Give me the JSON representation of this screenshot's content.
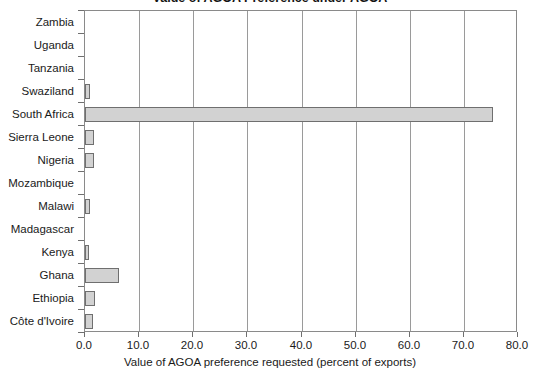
{
  "chart_data": {
    "type": "bar",
    "orientation": "horizontal",
    "title": "Value of AGOA Preference under AGOA",
    "xlabel": "Value of AGOA preference requested (percent of exports)",
    "ylabel": "",
    "xlim": [
      0.0,
      80.0
    ],
    "xticks": [
      "0.0",
      "10.0",
      "20.0",
      "30.0",
      "40.0",
      "50.0",
      "60.0",
      "70.0",
      "80.0"
    ],
    "xtick_values": [
      0,
      10,
      20,
      30,
      40,
      50,
      60,
      70,
      80
    ],
    "grid": "vertical",
    "legend": "none",
    "bar_color": "#d2d2d2",
    "bar_edge_color": "#6f6f6f",
    "categories": [
      "Zambia",
      "Uganda",
      "Tanzania",
      "Swaziland",
      "South Africa",
      "Sierra Leone",
      "Nigeria",
      "Mozambique",
      "Malawi",
      "Madagascar",
      "Kenya",
      "Ghana",
      "Ethiopia",
      "Côte d'Ivoire"
    ],
    "values": [
      0.0,
      0.0,
      0.0,
      1.0,
      75.4,
      1.7,
      1.7,
      0.0,
      0.9,
      0.0,
      0.8,
      6.3,
      1.8,
      1.4
    ]
  }
}
